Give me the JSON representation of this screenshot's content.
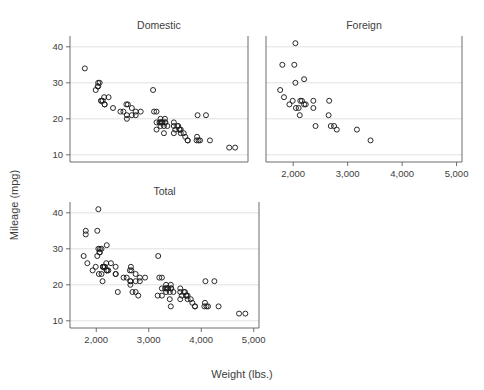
{
  "figure": {
    "xlabel": "Weight (lbs.)",
    "ylabel": "Mileage (mpg)",
    "background": "#ffffff",
    "marker_color": "#1f1f1f",
    "grid_color": "#d9d9d9",
    "frame_color": "#5c5c5c"
  },
  "chart_data": {
    "type": "scatter",
    "title": "",
    "xlabel": "Weight (lbs.)",
    "ylabel": "Mileage (mpg)",
    "xlim": [
      1500,
      5100
    ],
    "ylim": [
      8,
      43
    ],
    "xticks": [
      2000,
      3000,
      4000,
      5000
    ],
    "xticklabels": [
      "2,000",
      "3,000",
      "4,000",
      "5,000"
    ],
    "yticks": [
      10,
      20,
      30,
      40
    ],
    "yticklabels": [
      "10",
      "20",
      "30",
      "40"
    ],
    "grid": "horizontal",
    "legend": "none",
    "marker": "open-circle",
    "panels": [
      {
        "name": "domestic",
        "title": "Domestic",
        "points": [
          [
            4080,
            21
          ],
          [
            3250,
            17
          ],
          [
            4250,
            21
          ],
          [
            3470,
            18
          ],
          [
            3880,
            14
          ],
          [
            3400,
            16
          ],
          [
            3360,
            19
          ],
          [
            3720,
            17
          ],
          [
            3430,
            19
          ],
          [
            3880,
            14
          ],
          [
            4060,
            14
          ],
          [
            3600,
            16
          ],
          [
            3330,
            19
          ],
          [
            3600,
            19
          ],
          [
            3740,
            17
          ],
          [
            4840,
            12
          ],
          [
            4720,
            12
          ],
          [
            3830,
            15
          ],
          [
            4130,
            14
          ],
          [
            3600,
            18
          ],
          [
            4330,
            14
          ],
          [
            2930,
            22
          ],
          [
            3250,
            22
          ],
          [
            3200,
            22
          ],
          [
            2640,
            24
          ],
          [
            3180,
            28
          ],
          [
            2670,
            24
          ],
          [
            2750,
            21
          ],
          [
            2280,
            26
          ],
          [
            2750,
            23
          ],
          [
            2370,
            23
          ],
          [
            2020,
            28
          ],
          [
            2130,
            25
          ],
          [
            2190,
            26
          ],
          [
            2650,
            20
          ],
          [
            1800,
            34
          ],
          [
            2070,
            30
          ],
          [
            2130,
            25
          ],
          [
            2650,
            21
          ],
          [
            2160,
            25
          ],
          [
            3370,
            19
          ],
          [
            3400,
            18
          ],
          [
            3420,
            19
          ],
          [
            3250,
            19
          ],
          [
            3330,
            18
          ],
          [
            2830,
            22
          ],
          [
            2200,
            24
          ],
          [
            2520,
            22
          ],
          [
            2580,
            22
          ],
          [
            3310,
            19
          ],
          [
            2830,
            21
          ],
          [
            2200,
            24
          ],
          [
            3350,
            19
          ],
          [
            2070,
            29
          ],
          [
            2060,
            29
          ],
          [
            2100,
            30
          ],
          [
            3630,
            17
          ],
          [
            3670,
            18
          ],
          [
            3690,
            18
          ],
          [
            3710,
            17
          ],
          [
            3740,
            16
          ],
          [
            3800,
            16
          ],
          [
            4070,
            15
          ],
          [
            4100,
            14
          ],
          [
            3330,
            20
          ],
          [
            3420,
            20
          ]
        ]
      },
      {
        "name": "foreign",
        "title": "Foreign",
        "points": [
          [
            2800,
            17
          ],
          [
            2050,
            23
          ],
          [
            2130,
            25
          ],
          [
            2650,
            21
          ],
          [
            1760,
            28
          ],
          [
            2160,
            25
          ],
          [
            2040,
            30
          ],
          [
            1930,
            24
          ],
          [
            1990,
            25
          ],
          [
            3170,
            17
          ],
          [
            2690,
            18
          ],
          [
            2660,
            25
          ],
          [
            2750,
            18
          ],
          [
            2120,
            21
          ],
          [
            2410,
            18
          ],
          [
            2370,
            23
          ],
          [
            2230,
            24
          ],
          [
            2370,
            25
          ],
          [
            2100,
            23
          ],
          [
            2200,
            24
          ],
          [
            1800,
            35
          ],
          [
            2020,
            35
          ],
          [
            2040,
            41
          ],
          [
            3420,
            14
          ],
          [
            1830,
            26
          ],
          [
            2200,
            31
          ]
        ]
      },
      {
        "name": "total",
        "title": "Total",
        "points": [
          [
            4080,
            21
          ],
          [
            3250,
            17
          ],
          [
            4250,
            21
          ],
          [
            3470,
            18
          ],
          [
            3880,
            14
          ],
          [
            3400,
            16
          ],
          [
            3360,
            19
          ],
          [
            3720,
            17
          ],
          [
            3430,
            19
          ],
          [
            3880,
            14
          ],
          [
            4060,
            14
          ],
          [
            3600,
            16
          ],
          [
            3330,
            19
          ],
          [
            3600,
            19
          ],
          [
            3740,
            17
          ],
          [
            4840,
            12
          ],
          [
            4720,
            12
          ],
          [
            3830,
            15
          ],
          [
            4130,
            14
          ],
          [
            3600,
            18
          ],
          [
            4330,
            14
          ],
          [
            2930,
            22
          ],
          [
            3250,
            22
          ],
          [
            3200,
            22
          ],
          [
            2640,
            24
          ],
          [
            3180,
            28
          ],
          [
            2670,
            24
          ],
          [
            2750,
            21
          ],
          [
            2280,
            26
          ],
          [
            2750,
            23
          ],
          [
            2370,
            23
          ],
          [
            2020,
            28
          ],
          [
            2130,
            25
          ],
          [
            2190,
            26
          ],
          [
            2650,
            20
          ],
          [
            1800,
            34
          ],
          [
            2070,
            30
          ],
          [
            2130,
            25
          ],
          [
            2650,
            21
          ],
          [
            2160,
            25
          ],
          [
            3370,
            19
          ],
          [
            3400,
            18
          ],
          [
            3420,
            19
          ],
          [
            3250,
            19
          ],
          [
            3330,
            18
          ],
          [
            2830,
            22
          ],
          [
            2200,
            24
          ],
          [
            2520,
            22
          ],
          [
            2580,
            22
          ],
          [
            3310,
            19
          ],
          [
            2830,
            21
          ],
          [
            2200,
            24
          ],
          [
            3350,
            19
          ],
          [
            2070,
            29
          ],
          [
            2060,
            29
          ],
          [
            2100,
            30
          ],
          [
            3630,
            17
          ],
          [
            3670,
            18
          ],
          [
            3690,
            18
          ],
          [
            3710,
            17
          ],
          [
            3740,
            16
          ],
          [
            3800,
            16
          ],
          [
            4070,
            15
          ],
          [
            4100,
            14
          ],
          [
            3330,
            20
          ],
          [
            3420,
            20
          ],
          [
            2800,
            17
          ],
          [
            2050,
            23
          ],
          [
            2130,
            25
          ],
          [
            2650,
            21
          ],
          [
            1760,
            28
          ],
          [
            2160,
            25
          ],
          [
            2040,
            30
          ],
          [
            1930,
            24
          ],
          [
            1990,
            25
          ],
          [
            3170,
            17
          ],
          [
            2690,
            18
          ],
          [
            2660,
            25
          ],
          [
            2750,
            18
          ],
          [
            2120,
            21
          ],
          [
            2410,
            18
          ],
          [
            2370,
            23
          ],
          [
            2230,
            24
          ],
          [
            2370,
            25
          ],
          [
            2100,
            23
          ],
          [
            2200,
            24
          ],
          [
            1800,
            35
          ],
          [
            2020,
            35
          ],
          [
            2040,
            41
          ],
          [
            3420,
            14
          ],
          [
            1830,
            26
          ],
          [
            2200,
            31
          ]
        ]
      }
    ]
  }
}
